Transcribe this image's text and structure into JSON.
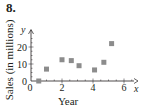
{
  "problem": {
    "number": "8."
  },
  "chart_data": {
    "type": "scatter",
    "title": "",
    "xlabel": "Year",
    "ylabel": "Sales (in millions)",
    "x_axis_var": "x",
    "y_axis_var": "y",
    "xlim": [
      0,
      7
    ],
    "ylim": [
      0,
      27
    ],
    "x_ticks": [
      0,
      2,
      4,
      6
    ],
    "y_ticks": [
      0,
      10,
      20
    ],
    "grid": false,
    "legend": null,
    "marker_color": "#8c8c8c",
    "series": [
      {
        "name": "Sales",
        "points": [
          {
            "x": 0.5,
            "y": 0
          },
          {
            "x": 1.0,
            "y": 7
          },
          {
            "x": 2.0,
            "y": 12.5
          },
          {
            "x": 2.6,
            "y": 12
          },
          {
            "x": 3.1,
            "y": 9
          },
          {
            "x": 4.1,
            "y": 6.5
          },
          {
            "x": 4.7,
            "y": 11
          },
          {
            "x": 5.2,
            "y": 22
          }
        ]
      }
    ]
  }
}
